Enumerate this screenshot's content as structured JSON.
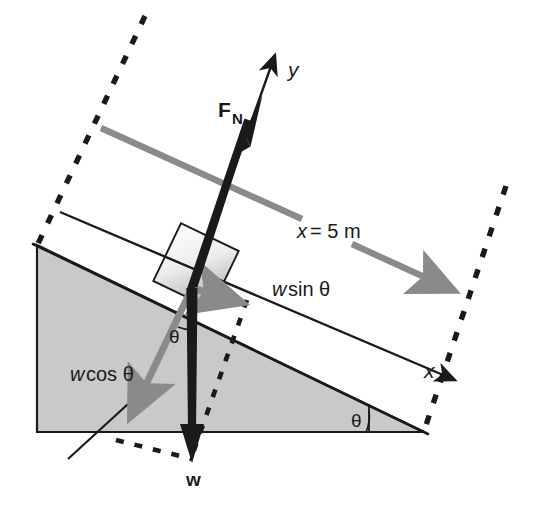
{
  "figure": {
    "background_color": "#ffffff"
  },
  "colors": {
    "incline_fill": "#c9c9c9",
    "incline_stroke": "#1a1a1a",
    "block_fill_light": "#fbfbfb",
    "block_fill_dark": "#b4b4b4",
    "block_stroke": "#1a1a1a",
    "vector_black": "#1a1a1a",
    "vector_gray": "#8a8a8a",
    "dashed_black": "#1a1a1a",
    "text": "#1a1a1a"
  },
  "labels": {
    "y_axis": "y",
    "x_axis": "x",
    "normal_force": {
      "symbol": "F",
      "subscript": "N"
    },
    "weight": "w",
    "weight_parallel": "w sin θ",
    "weight_perpendicular": "w cos θ",
    "distance": "x = 5 m",
    "angle_incline_base": "θ",
    "angle_at_block": "θ",
    "italic_w": "w",
    "sin_theta": "sin θ",
    "cos_theta": "cos θ",
    "italic_x": "x",
    "equals_five_m": "= 5 m"
  },
  "geometry": {
    "incline_angle_deg": 14,
    "origin": {
      "x": 192,
      "y": 288
    },
    "incline_apex_top_left": {
      "x": 37,
      "y": 245
    },
    "incline_bottom_left": {
      "x": 37,
      "y": 432
    },
    "incline_bottom_right": {
      "x": 424,
      "y": 432
    },
    "block_center": {
      "x": 196,
      "y": 266
    },
    "block_size": 64
  },
  "vectors": [
    {
      "name": "normal-force",
      "label": "F_N",
      "color": "#1a1a1a",
      "style": "thick-black",
      "from": {
        "x": 192,
        "y": 288
      },
      "to": {
        "x": 249,
        "y": 108
      }
    },
    {
      "name": "weight",
      "label": "w",
      "color": "#1a1a1a",
      "style": "thick-black",
      "from": {
        "x": 192,
        "y": 288
      },
      "to": {
        "x": 191,
        "y": 460
      }
    },
    {
      "name": "weight-parallel",
      "label": "w sin θ",
      "color": "#8a8a8a",
      "style": "gray",
      "from": {
        "x": 192,
        "y": 288
      },
      "to": {
        "x": 252,
        "y": 307
      }
    },
    {
      "name": "weight-perpendicular",
      "label": "w cos θ",
      "color": "#8a8a8a",
      "style": "gray",
      "from": {
        "x": 192,
        "y": 288
      },
      "to": {
        "x": 126,
        "y": 427
      }
    },
    {
      "name": "distance-upper",
      "label": "x = 5 m",
      "color": "#8a8a8a",
      "style": "gray",
      "from": {
        "x": 101,
        "y": 128
      },
      "to": {
        "x": 307,
        "y": 221
      }
    },
    {
      "name": "distance-lower",
      "label": "x = 5 m",
      "color": "#8a8a8a",
      "style": "gray",
      "from": {
        "x": 352,
        "y": 244
      },
      "to": {
        "x": 463,
        "y": 295
      }
    },
    {
      "name": "y-axis",
      "label": "y",
      "color": "#1a1a1a",
      "style": "thin-black",
      "from": {
        "x": 192,
        "y": 288
      },
      "to": {
        "x": 277,
        "y": 49
      }
    },
    {
      "name": "x-axis",
      "label": "x",
      "color": "#1a1a1a",
      "style": "thin-black",
      "from": {
        "x": 60,
        "y": 213
      },
      "to": {
        "x": 460,
        "y": 383
      }
    }
  ],
  "dashed_lines": [
    {
      "name": "left-boundary",
      "from": {
        "x": 145,
        "y": 16
      },
      "to": {
        "x": 37,
        "y": 245
      }
    },
    {
      "name": "right-boundary",
      "from": {
        "x": 505,
        "y": 186
      },
      "to": {
        "x": 424,
        "y": 432
      }
    },
    {
      "name": "block-vertical",
      "from": {
        "x": 246,
        "y": 302
      },
      "to": {
        "x": 191,
        "y": 455
      }
    },
    {
      "name": "bottom-cross",
      "from": {
        "x": 117,
        "y": 442
      },
      "to": {
        "x": 191,
        "y": 458
      }
    }
  ]
}
